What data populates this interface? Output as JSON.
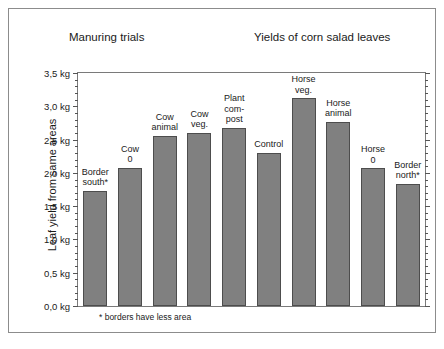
{
  "titles": {
    "left": "Manuring trials",
    "right": "Yields of corn salad leaves"
  },
  "footnote": "* borders have less area",
  "chart_data": {
    "type": "bar",
    "title": "Yields of corn salad leaves",
    "subtitle": "Manuring trials",
    "xlabel": "",
    "ylabel": "Leaf yield from same areas",
    "ylim": [
      0,
      3.5
    ],
    "ytick_step": 0.5,
    "ytick_labels": [
      "0,0 kg",
      "0,5 kg",
      "1,0 kg",
      "1,5 kg",
      "2,0 kg",
      "2,5 kg",
      "3,0 kg",
      "3,5 kg"
    ],
    "ytick_values": [
      0,
      0.5,
      1.0,
      1.5,
      2.0,
      2.5,
      3.0,
      3.5
    ],
    "unit": "kg",
    "grid": false,
    "legend": "none",
    "bar_color": "#808080",
    "bar_edge_color": "#4d4d4d",
    "categories": [
      "Border south*",
      "Cow 0",
      "Cow animal",
      "Cow veg.",
      "Plant com-post",
      "Control",
      "Horse veg.",
      "Horse animal",
      "Horse 0",
      "Border north*"
    ],
    "category_labels": [
      "Border\nsouth*",
      "Cow\n0",
      "Cow\nanimal",
      "Cow\nveg.",
      "Plant\ncom-\npost",
      "Control",
      "Horse\nveg.",
      "Horse\nanimal",
      "Horse\n0",
      "Border\nnorth*"
    ],
    "values": [
      1.73,
      2.08,
      2.56,
      2.6,
      2.68,
      2.3,
      3.12,
      2.77,
      2.07,
      1.84
    ],
    "annotations": [
      "* borders have less area"
    ]
  }
}
